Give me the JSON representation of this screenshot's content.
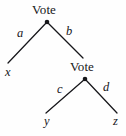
{
  "figure": {
    "type": "game-tree-diagram",
    "background_color": "#fefefe",
    "ink_color": "#16161a",
    "width": 126,
    "height": 136
  },
  "nodes": [
    {
      "id": "root",
      "label": "Vote",
      "label_x": 32,
      "label_y": 3,
      "dot_x": 47,
      "dot_y": 22
    },
    {
      "id": "second",
      "label": "Vote",
      "label_x": 70,
      "label_y": 60,
      "dot_x": 85,
      "dot_y": 79
    }
  ],
  "edges": [
    {
      "id": "root-left",
      "label": "a",
      "label_x": 17,
      "label_y": 27,
      "x1": 47,
      "y1": 22,
      "x2": 8,
      "y2": 63
    },
    {
      "id": "root-right",
      "label": "b",
      "label_x": 66,
      "label_y": 25,
      "x1": 47,
      "y1": 22,
      "x2": 83,
      "y2": 58
    },
    {
      "id": "second-left",
      "label": "c",
      "label_x": 57,
      "label_y": 83,
      "x1": 85,
      "y1": 79,
      "x2": 46,
      "y2": 113
    },
    {
      "id": "second-right",
      "label": "d",
      "label_x": 103,
      "label_y": 81,
      "x1": 85,
      "y1": 79,
      "x2": 117,
      "y2": 113
    }
  ],
  "leaves": [
    {
      "id": "x",
      "label": "x",
      "x": 5,
      "y": 66
    },
    {
      "id": "y",
      "label": "y",
      "x": 44,
      "y": 115
    },
    {
      "id": "z",
      "label": "z",
      "x": 113,
      "y": 115
    }
  ]
}
